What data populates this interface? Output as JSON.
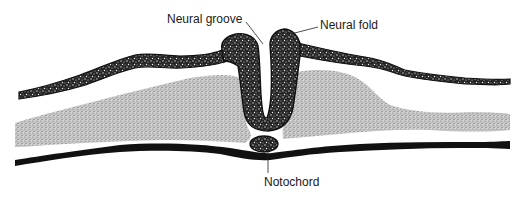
{
  "diagram": {
    "type": "embryo-cross-section",
    "labels": {
      "neural_groove": "Neural groove",
      "neural_fold": "Neural fold",
      "notochord": "Notochord"
    },
    "colors": {
      "ink": "#111111",
      "dark_stipple_bg": "#2a2a2a",
      "light_stipple_bg": "#b5b5b5",
      "background": "#ffffff"
    }
  }
}
